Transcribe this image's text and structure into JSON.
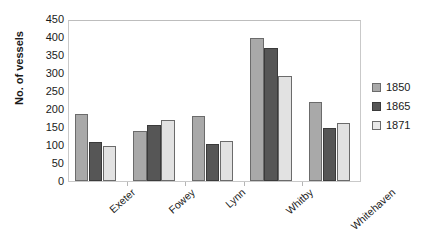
{
  "chart_data": {
    "type": "bar",
    "title": "",
    "xlabel": "",
    "ylabel": "No. of vessels",
    "categories": [
      "Exeter",
      "Fowey",
      "Lynn",
      "Whitby",
      "Whitehaven"
    ],
    "series": [
      {
        "name": "1850",
        "color": "#a9a9a9",
        "values": [
          185,
          138,
          180,
          398,
          220
        ]
      },
      {
        "name": "1865",
        "color": "#565656",
        "values": [
          108,
          155,
          102,
          370,
          148
        ]
      },
      {
        "name": "1871",
        "color": "#e2e2e2",
        "values": [
          97,
          170,
          110,
          292,
          160
        ]
      }
    ],
    "ylim": [
      0,
      450
    ],
    "ytick_step": 50,
    "yticks": [
      0,
      50,
      100,
      150,
      200,
      250,
      300,
      350,
      400,
      450
    ],
    "ytick_labels": [
      "0",
      "50",
      "100",
      "150",
      "200",
      "250",
      "300",
      "350",
      "400",
      "450"
    ],
    "grid": false,
    "legend_position": "right",
    "xtick_label_rotation": -42
  }
}
